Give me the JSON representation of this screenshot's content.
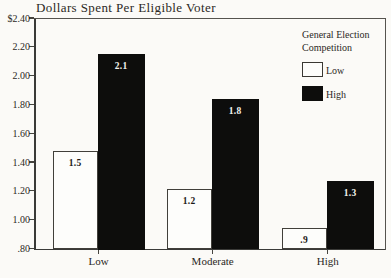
{
  "figure": {
    "title": "Dollars Spent Per Eligible Voter",
    "background_color": "#fbfaf7",
    "axis_color": "#3a3a38",
    "text_color": "#2b2824"
  },
  "legend": {
    "title_line1": "General Election",
    "title_line2": "Competition",
    "items": [
      {
        "label": "Low",
        "fill": "#fdfdfb",
        "border": "#3a3833"
      },
      {
        "label": "High",
        "fill": "#0d0d0c",
        "border": "#0d0d0c"
      }
    ]
  },
  "chart_data": {
    "type": "bar",
    "title": "Dollars Spent Per Eligible Voter",
    "xlabel": "",
    "ylabel": "",
    "categories": [
      "Low",
      "Moderate",
      "High"
    ],
    "series": [
      {
        "name": "Low",
        "values": [
          1.5,
          1.2,
          0.9
        ],
        "value_labels": [
          "1.5",
          "1.2",
          ".9"
        ],
        "drawn_values": [
          1.48,
          1.21,
          0.94
        ],
        "fill": "#fdfdfb",
        "label_color": "#1c1a17"
      },
      {
        "name": "High",
        "values": [
          2.1,
          1.8,
          1.3
        ],
        "value_labels": [
          "2.1",
          "1.8",
          "1.3"
        ],
        "drawn_values": [
          2.15,
          1.84,
          1.27
        ],
        "fill": "#0d0d0c",
        "label_color": "#f4f3ee"
      }
    ],
    "y_axis": {
      "min": 0.8,
      "max": 2.4,
      "tick_step": 0.2,
      "tick_labels_top_to_bottom": [
        "$2.40",
        "2.20",
        "2.00",
        "1.80",
        "1.60",
        "1.40",
        "1.20",
        "1.00",
        ".80"
      ]
    },
    "grid": false,
    "legend_position": "upper-right",
    "legend_title": "General Election Competition"
  }
}
